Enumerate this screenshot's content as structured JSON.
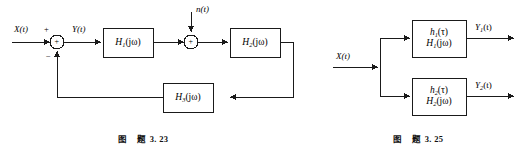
{
  "sheet": {
    "background_color": "#ffffff",
    "line_color": "#1a1a1a"
  },
  "figures": [
    {
      "id": "feedback-system",
      "caption_prefix": "图",
      "caption_label": "题",
      "caption_number": "3. 23",
      "input_signal": "X(t)",
      "intermediate_signal": "Y(t)",
      "noise_signal": "n(t)",
      "summing_junction_1": {
        "input_sign": "+",
        "inner_sign": "+",
        "feedback_sign": "−"
      },
      "summing_junction_2": {
        "inner_sign": "+"
      },
      "blocks": [
        {
          "name": "forward-block-1",
          "symbol": "H",
          "subscript": "1",
          "arg": "(jω)"
        },
        {
          "name": "forward-block-2",
          "symbol": "H",
          "subscript": "2",
          "arg": "(jω)"
        },
        {
          "name": "feedback-block",
          "symbol": "H",
          "subscript": "3",
          "arg": "(jω)"
        }
      ]
    },
    {
      "id": "parallel-system",
      "caption_prefix": "图",
      "caption_label": "题",
      "caption_number": "3. 25",
      "input_signal": "X(t)",
      "branches": [
        {
          "name": "branch-upper",
          "impulse_symbol": "h",
          "impulse_subscript": "1",
          "impulse_arg": "(τ)",
          "transfer_symbol": "H",
          "transfer_subscript": "1",
          "transfer_arg": "(jω)",
          "output_signal_symbol": "Y",
          "output_signal_subscript": "1",
          "output_signal_arg": "(t)"
        },
        {
          "name": "branch-lower",
          "impulse_symbol": "h",
          "impulse_subscript": "2",
          "impulse_arg": "(τ)",
          "transfer_symbol": "H",
          "transfer_subscript": "2",
          "transfer_arg": "(jω)",
          "output_signal_symbol": "Y",
          "output_signal_subscript": "2",
          "output_signal_arg": "(t)"
        }
      ]
    }
  ]
}
